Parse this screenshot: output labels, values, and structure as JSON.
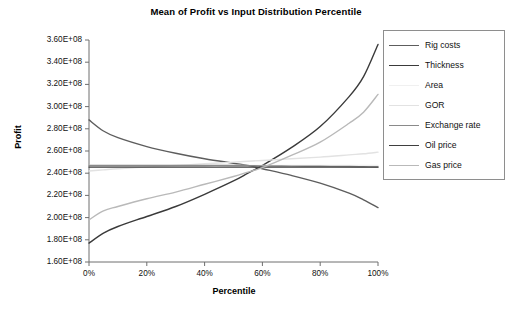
{
  "chart_data": {
    "type": "line",
    "title": "Mean of Profit vs Input Distribution Percentile",
    "xlabel": "Percentile",
    "ylabel": "Profit",
    "xlim": [
      0,
      100
    ],
    "ylim": [
      160000000,
      360000000
    ],
    "grid": false,
    "legend_position": "right",
    "x_tick_labels": [
      "0%",
      "20%",
      "40%",
      "60%",
      "80%",
      "100%"
    ],
    "x_tick_values": [
      0,
      20,
      40,
      60,
      80,
      100
    ],
    "y_tick_labels": [
      "3.60E+08",
      "3.40E+08",
      "3.20E+08",
      "3.00E+08",
      "2.80E+08",
      "2.60E+08",
      "2.40E+08",
      "2.20E+08",
      "2.00E+08",
      "1.80E+08",
      "1.60E+08"
    ],
    "y_tick_values": [
      360000000,
      340000000,
      320000000,
      300000000,
      280000000,
      260000000,
      240000000,
      220000000,
      200000000,
      180000000,
      160000000
    ],
    "x": [
      0,
      5,
      10,
      20,
      30,
      40,
      50,
      55,
      60,
      70,
      80,
      90,
      95,
      100
    ],
    "series": [
      {
        "name": "Rig costs",
        "color": "#5d5d5d",
        "values": [
          288000000,
          278000000,
          272000000,
          264000000,
          258000000,
          253000000,
          249000000,
          247000000,
          244000000,
          238000000,
          231000000,
          222000000,
          216000000,
          209000000
        ]
      },
      {
        "name": "Thickness",
        "color": "#3a3a3a",
        "values": [
          177000000,
          186000000,
          192000000,
          201000000,
          210000000,
          221000000,
          233000000,
          240000000,
          247000000,
          263000000,
          282000000,
          309000000,
          327000000,
          356000000
        ]
      },
      {
        "name": "Area",
        "color": "#f0f0f0",
        "values": [
          247000000,
          247000000,
          247000000,
          247000000,
          247000000,
          247000000,
          247000000,
          247000000,
          247000000,
          247000000,
          247000000,
          247000000,
          247000000,
          247000000
        ]
      },
      {
        "name": "GOR",
        "color": "#e2e2e2",
        "values": [
          242000000,
          243000000,
          244000000,
          245500000,
          247000000,
          248500000,
          250000000,
          250800000,
          251500000,
          253000000,
          254500000,
          256500000,
          257500000,
          259000000
        ]
      },
      {
        "name": "Exchange rate",
        "color": "#8a8a8a",
        "values": [
          247000000,
          247000000,
          247000000,
          247000000,
          247000000,
          247000000,
          247000000,
          246800000,
          246600000,
          246400000,
          246200000,
          246000000,
          245800000,
          245600000
        ]
      },
      {
        "name": "Oil price",
        "color": "#3f3f3f",
        "values": [
          245500000,
          245500000,
          245500000,
          245500000,
          245500000,
          245500000,
          245500000,
          245500000,
          245500000,
          245500000,
          245500000,
          245500000,
          245500000,
          245500000
        ]
      },
      {
        "name": "Gas price",
        "color": "#b9b9b9",
        "values": [
          198000000,
          206000000,
          210000000,
          217000000,
          223000000,
          230000000,
          237000000,
          241000000,
          245000000,
          256000000,
          268000000,
          285000000,
          295000000,
          311000000
        ]
      }
    ]
  },
  "legend": {
    "items": [
      {
        "label": "Rig costs"
      },
      {
        "label": "Thickness"
      },
      {
        "label": "Area"
      },
      {
        "label": "GOR"
      },
      {
        "label": "Exchange rate"
      },
      {
        "label": "Oil price"
      },
      {
        "label": "Gas price"
      }
    ]
  }
}
